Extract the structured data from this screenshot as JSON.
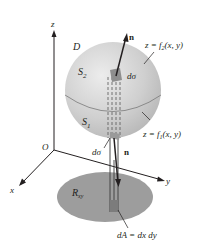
{
  "diagram": {
    "axes": {
      "x": "x",
      "y": "y",
      "z": "z",
      "origin": "O"
    },
    "labels": {
      "region_D": "D",
      "upper_surface": "S",
      "upper_sub": "2",
      "lower_surface": "S",
      "lower_sub": "1",
      "normal_top": "n",
      "normal_bottom": "n",
      "dsigma_top": "dσ",
      "dsigma_bottom": "dσ",
      "f2_eq": "z = f",
      "f2_sub": "2",
      "f2_args": "(x, y)",
      "f1_eq": "z = f",
      "f1_sub": "1",
      "f1_args": "(x, y)",
      "region_R": "R",
      "region_R_sub": "xy",
      "dA_eq": "dA = dx dy"
    },
    "colors": {
      "sphere": "#c8c8c8",
      "sphere_highlight": "#e6e6e6",
      "region": "#9a9a9a",
      "lines": "#231f20"
    }
  }
}
